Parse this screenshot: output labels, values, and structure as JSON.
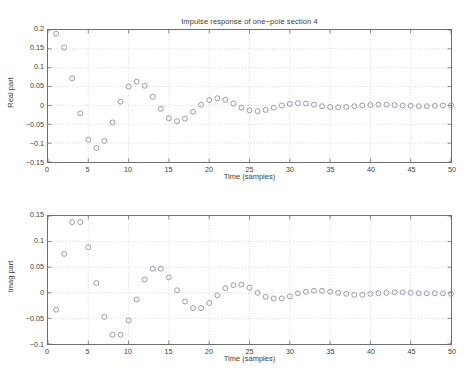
{
  "figure": {
    "title": "Impulse response of one−pole section 4",
    "marker_color": "#8a8fa8",
    "axis_color": "#6e6e6e",
    "grid_color": "#c8c8c8"
  },
  "chart_data": [
    {
      "type": "scatter",
      "id": "real-part",
      "title": "Impulse response of one−pole section 4",
      "xlabel": "Time (samples)",
      "ylabel": "Real part",
      "xlim": [
        0,
        50
      ],
      "ylim": [
        -0.15,
        0.2
      ],
      "xticks": [
        0,
        5,
        10,
        15,
        20,
        25,
        30,
        35,
        40,
        45,
        50
      ],
      "xtick_labels": [
        "0",
        "5",
        "10",
        "15",
        "20",
        "25",
        "30",
        "35",
        "40",
        "45",
        "50"
      ],
      "yticks": [
        -0.15,
        -0.1,
        -0.05,
        0,
        0.05,
        0.1,
        0.15,
        0.2
      ],
      "ytick_labels": [
        "−0.15",
        "−0.1",
        "−0.05",
        "0",
        "0.05",
        "0.1",
        "0.15",
        "0.2"
      ],
      "grid": true,
      "legend": null,
      "marker": "open-circle",
      "x": [
        1,
        2,
        3,
        4,
        5,
        6,
        7,
        8,
        9,
        10,
        11,
        12,
        13,
        14,
        15,
        16,
        17,
        18,
        19,
        20,
        21,
        22,
        23,
        24,
        25,
        26,
        27,
        28,
        29,
        30,
        31,
        32,
        33,
        34,
        35,
        36,
        37,
        38,
        39,
        40,
        41,
        42,
        43,
        44,
        45,
        46,
        47,
        48,
        49,
        50
      ],
      "y": [
        0.19,
        0.154,
        0.072,
        -0.021,
        -0.091,
        -0.113,
        -0.094,
        -0.045,
        0.01,
        0.05,
        0.063,
        0.052,
        0.023,
        -0.009,
        -0.034,
        -0.042,
        -0.035,
        -0.017,
        0.002,
        0.014,
        0.019,
        0.015,
        0.005,
        -0.006,
        -0.013,
        -0.015,
        -0.012,
        -0.006,
        0.0,
        0.004,
        0.006,
        0.005,
        0.002,
        -0.002,
        -0.004,
        -0.005,
        -0.004,
        -0.002,
        0.0,
        0.001,
        0.002,
        0.002,
        0.001,
        0.0,
        -0.001,
        -0.002,
        -0.002,
        -0.001,
        0.0,
        0.0
      ]
    },
    {
      "type": "scatter",
      "id": "imag-part",
      "title": "",
      "xlabel": "Time (samples)",
      "ylabel": "Imag part",
      "xlim": [
        0,
        50
      ],
      "ylim": [
        -0.1,
        0.15
      ],
      "xticks": [
        0,
        5,
        10,
        15,
        20,
        25,
        30,
        35,
        40,
        45,
        50
      ],
      "xtick_labels": [
        "0",
        "5",
        "10",
        "15",
        "20",
        "25",
        "30",
        "35",
        "40",
        "45",
        "50"
      ],
      "yticks": [
        -0.1,
        -0.05,
        0,
        0.05,
        0.1,
        0.15
      ],
      "ytick_labels": [
        "−0.1",
        "−0.05",
        "0",
        "0.05",
        "0.1",
        "0.15"
      ],
      "grid": true,
      "legend": null,
      "marker": "open-circle",
      "x": [
        1,
        2,
        3,
        4,
        5,
        6,
        7,
        8,
        9,
        10,
        11,
        12,
        13,
        14,
        15,
        16,
        17,
        18,
        19,
        20,
        21,
        22,
        23,
        24,
        25,
        26,
        27,
        28,
        29,
        30,
        31,
        32,
        33,
        34,
        35,
        36,
        37,
        38,
        39,
        40,
        41,
        42,
        43,
        44,
        45,
        46,
        47,
        48,
        49,
        50
      ],
      "y": [
        -0.033,
        0.076,
        0.138,
        0.138,
        0.089,
        0.019,
        -0.047,
        -0.082,
        -0.082,
        -0.054,
        -0.013,
        0.026,
        0.047,
        0.047,
        0.03,
        0.005,
        -0.017,
        -0.03,
        -0.03,
        -0.02,
        -0.005,
        0.009,
        0.015,
        0.016,
        0.01,
        0.0,
        -0.008,
        -0.011,
        -0.011,
        -0.007,
        -0.001,
        0.002,
        0.004,
        0.004,
        0.002,
        0.0,
        -0.002,
        -0.004,
        -0.004,
        -0.002,
        -0.001,
        0.0,
        0.001,
        0.001,
        0.0,
        -0.001,
        -0.001,
        -0.001,
        -0.001,
        -0.002
      ]
    }
  ]
}
